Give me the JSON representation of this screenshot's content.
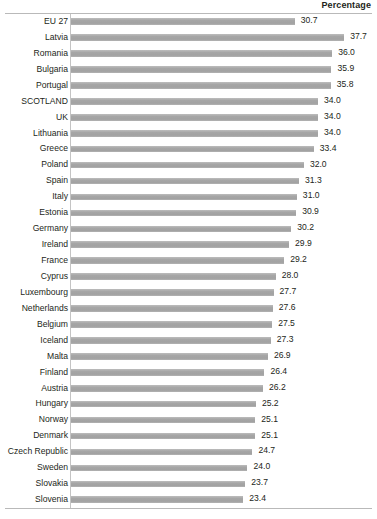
{
  "header": {
    "title": "Percentage"
  },
  "chart_data": {
    "type": "bar",
    "orientation": "horizontal",
    "title": "",
    "subtitle": "",
    "xlabel": "Percentage",
    "ylabel": "",
    "grid": false,
    "legend": null,
    "value_labels": true,
    "value_format": "one-decimal",
    "xlim": [
      0,
      40
    ],
    "axis_zero_px": 78,
    "px_per_unit": 7.06,
    "bar_color": "#a9a9a9",
    "highlight_category": "SCOTLAND",
    "categories": [
      "EU 27",
      "Latvia",
      "Romania",
      "Bulgaria",
      "Portugal",
      "SCOTLAND",
      "UK",
      "Lithuania",
      "Greece",
      "Poland",
      "Spain",
      "Italy",
      "Estonia",
      "Germany",
      "Ireland",
      "France",
      "Cyprus",
      "Luxembourg",
      "Netherlands",
      "Belgium",
      "Iceland",
      "Malta",
      "Finland",
      "Austria",
      "Hungary",
      "Norway",
      "Denmark",
      "Czech Republic",
      "Sweden",
      "Slovakia",
      "Slovenia"
    ],
    "values": [
      30.7,
      37.7,
      36.0,
      35.9,
      35.8,
      34.0,
      34.0,
      34.0,
      33.4,
      32.0,
      31.3,
      31.0,
      30.9,
      30.2,
      29.9,
      29.2,
      28.0,
      27.7,
      27.6,
      27.5,
      27.3,
      26.9,
      26.4,
      26.2,
      25.2,
      25.1,
      25.1,
      24.7,
      24.0,
      23.7,
      23.4
    ],
    "value_labels_text": [
      "30.7",
      "37.7",
      "36.0",
      "35.9",
      "35.8",
      "34.0",
      "34.0",
      "34.0",
      "33.4",
      "32.0",
      "31.3",
      "31.0",
      "30.9",
      "30.2",
      "29.9",
      "29.2",
      "28.0",
      "27.7",
      "27.6",
      "27.5",
      "27.3",
      "26.9",
      "26.4",
      "26.2",
      "25.2",
      "25.1",
      "25.1",
      "24.7",
      "24.0",
      "23.7",
      "23.4"
    ]
  }
}
